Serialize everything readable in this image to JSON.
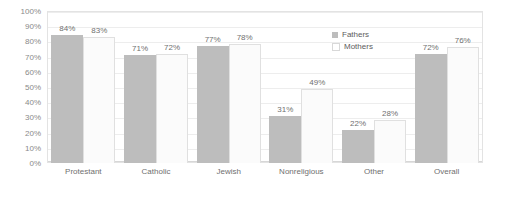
{
  "chart_data": {
    "type": "bar",
    "title": "",
    "xlabel": "",
    "ylabel": "",
    "ylim": [
      0,
      100
    ],
    "ytick_labels": [
      "100%",
      "90%",
      "80%",
      "70%",
      "60%",
      "50%",
      "40%",
      "30%",
      "20%",
      "10%",
      "0%"
    ],
    "ytick_values": [
      100,
      90,
      80,
      70,
      60,
      50,
      40,
      30,
      20,
      10,
      0
    ],
    "grid": true,
    "legend_position": "top-right-inside",
    "value_label_suffix": "%",
    "categories": [
      "Protestant",
      "Catholic",
      "Jewish",
      "Nonreligious",
      "Other",
      "Overall"
    ],
    "series": [
      {
        "name": "Fathers",
        "color": "#bdbdbd",
        "values": [
          84,
          71,
          77,
          31,
          22,
          72
        ],
        "labels": [
          "84%",
          "71%",
          "77%",
          "31%",
          "22%",
          "72%"
        ]
      },
      {
        "name": "Mothers",
        "color": "#fbfbfb",
        "border_color": "#e0e0e0",
        "values": [
          83,
          72,
          78,
          49,
          28,
          76
        ],
        "labels": [
          "83%",
          "72%",
          "78%",
          "49%",
          "28%",
          "76%"
        ]
      }
    ]
  },
  "legend": {
    "items": [
      {
        "label": "Fathers",
        "swatch": "filled-gray-square-icon"
      },
      {
        "label": "Mothers",
        "swatch": "outlined-white-square-icon"
      }
    ]
  }
}
